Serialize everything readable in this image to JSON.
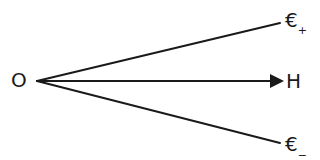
{
  "diagram": {
    "type": "vector-fan",
    "colors": {
      "stroke": "#1a1a1a",
      "background": "#ffffff"
    },
    "origin": {
      "label": "O",
      "x": 37,
      "y": 81
    },
    "rays": [
      {
        "id": "upper",
        "symbol": "€",
        "subscript": "+",
        "end": {
          "x": 280,
          "y": 23
        },
        "arrowhead": false
      },
      {
        "id": "middle",
        "symbol": "H",
        "subscript": "",
        "end": {
          "x": 283,
          "y": 81
        },
        "arrowhead": true
      },
      {
        "id": "lower",
        "symbol": "€",
        "subscript": "−",
        "end": {
          "x": 280,
          "y": 143
        },
        "arrowhead": false
      }
    ]
  }
}
